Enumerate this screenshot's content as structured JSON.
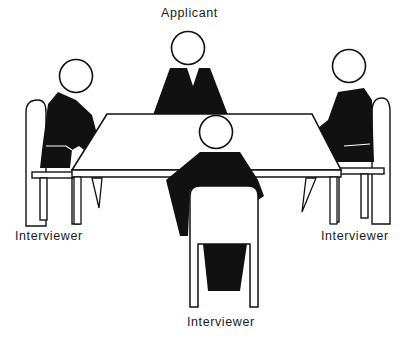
{
  "diagram": {
    "type": "seating-arrangement",
    "labels": {
      "applicant": "Applicant",
      "interviewer_left": "Interviewer",
      "interviewer_right": "Interviewer",
      "interviewer_front": "Interviewer"
    },
    "participants": [
      {
        "role": "Applicant",
        "position": "back-center"
      },
      {
        "role": "Interviewer",
        "position": "left"
      },
      {
        "role": "Interviewer",
        "position": "right"
      },
      {
        "role": "Interviewer",
        "position": "front-center"
      }
    ],
    "colors": {
      "ink": "#111111",
      "paper": "#ffffff"
    }
  }
}
